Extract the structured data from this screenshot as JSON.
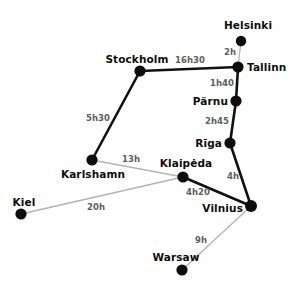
{
  "canvas": {
    "width": 293,
    "height": 289,
    "background": "#ffffff"
  },
  "style": {
    "dot_color": "#0d0d0d",
    "city_text_color": "#0d0d0d",
    "duration_text_color": "#5e5e5e",
    "primary_route_color": "#111111",
    "secondary_route_color": "#b3b3b3"
  },
  "cities": [
    {
      "name": "Helsinki",
      "x": 241,
      "y": 41,
      "r": 5.2,
      "label_x": 248,
      "label_y": 25,
      "anchor": "center"
    },
    {
      "name": "Tallinn",
      "x": 238,
      "y": 67,
      "r": 5.6,
      "label_x": 247,
      "label_y": 67,
      "anchor": "left"
    },
    {
      "name": "Pärnu",
      "x": 236,
      "y": 101,
      "r": 5.6,
      "label_x": 228,
      "label_y": 101,
      "anchor": "right"
    },
    {
      "name": "Rīga",
      "x": 230,
      "y": 143,
      "r": 5.6,
      "label_x": 222,
      "label_y": 143,
      "anchor": "right"
    },
    {
      "name": "Vilnius",
      "x": 251,
      "y": 206,
      "r": 6.0,
      "label_x": 243,
      "label_y": 208,
      "anchor": "right"
    },
    {
      "name": "Klaipėda",
      "x": 183,
      "y": 177,
      "r": 5.6,
      "label_x": 186,
      "label_y": 163,
      "anchor": "center"
    },
    {
      "name": "Karlshamn",
      "x": 92,
      "y": 160,
      "r": 5.6,
      "label_x": 93,
      "label_y": 174,
      "anchor": "center"
    },
    {
      "name": "Stockholm",
      "x": 140,
      "y": 71,
      "r": 5.6,
      "label_x": 137,
      "label_y": 59,
      "anchor": "center"
    },
    {
      "name": "Kiel",
      "x": 21,
      "y": 214,
      "r": 5.6,
      "label_x": 24,
      "label_y": 202,
      "anchor": "center"
    },
    {
      "name": "Warsaw",
      "x": 182,
      "y": 270,
      "r": 5.6,
      "label_x": 176,
      "label_y": 257,
      "anchor": "center"
    }
  ],
  "routes": [
    {
      "from": "Helsinki",
      "to": "Tallinn",
      "duration": "2h",
      "weight": "thin",
      "label_x": 230,
      "label_y": 52
    },
    {
      "from": "Stockholm",
      "to": "Tallinn",
      "duration": "16h30",
      "weight": "thick",
      "label_x": 190,
      "label_y": 60
    },
    {
      "from": "Tallinn",
      "to": "Pärnu",
      "duration": "1h40",
      "weight": "thick",
      "label_x": 222,
      "label_y": 83
    },
    {
      "from": "Pärnu",
      "to": "Rīga",
      "duration": "2h45",
      "weight": "thick",
      "label_x": 217,
      "label_y": 121
    },
    {
      "from": "Rīga",
      "to": "Vilnius",
      "duration": "4h",
      "weight": "thick",
      "label_x": 233,
      "label_y": 176
    },
    {
      "from": "Vilnius",
      "to": "Klaipėda",
      "duration": "4h20",
      "weight": "thick",
      "label_x": 198,
      "label_y": 192
    },
    {
      "from": "Stockholm",
      "to": "Karlshamn",
      "duration": "5h30",
      "weight": "thick",
      "label_x": 98,
      "label_y": 118
    },
    {
      "from": "Karlshamn",
      "to": "Klaipėda",
      "duration": "13h",
      "weight": "thin",
      "label_x": 131,
      "label_y": 159
    },
    {
      "from": "Kiel",
      "to": "Klaipėda",
      "duration": "20h",
      "weight": "thin",
      "label_x": 96,
      "label_y": 207
    },
    {
      "from": "Vilnius",
      "to": "Warsaw",
      "duration": "9h",
      "weight": "thin",
      "label_x": 201,
      "label_y": 240
    }
  ]
}
